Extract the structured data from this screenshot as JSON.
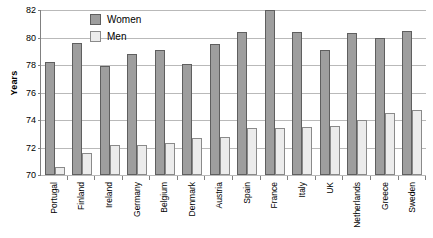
{
  "chart_data": {
    "type": "bar",
    "title": "",
    "xlabel": "",
    "ylabel": "Years",
    "ylim": [
      70,
      82
    ],
    "yticks": [
      70,
      72,
      74,
      76,
      78,
      80,
      82
    ],
    "grid": true,
    "legend_position": "top-center",
    "categories": [
      "Portugal",
      "Finland",
      "Ireland",
      "Germany",
      "Belgium",
      "Denmark",
      "Austria",
      "Spain",
      "France",
      "Italy",
      "UK",
      "Netherlands",
      "Greece",
      "Sweden"
    ],
    "series": [
      {
        "name": "Women",
        "color": "#9e9e9e",
        "values": [
          78.2,
          79.6,
          77.9,
          78.8,
          79.1,
          78.1,
          79.5,
          80.4,
          82.0,
          80.4,
          79.1,
          80.3,
          80.0,
          80.5
        ]
      },
      {
        "name": "Men",
        "color": "#ececec",
        "values": [
          70.6,
          71.6,
          72.2,
          72.2,
          72.3,
          72.7,
          72.8,
          73.4,
          73.4,
          73.5,
          73.6,
          74.0,
          74.5,
          74.7
        ]
      }
    ]
  },
  "legend": {
    "items": [
      {
        "label": "Women",
        "key": "women"
      },
      {
        "label": "Men",
        "key": "men"
      }
    ]
  },
  "axis": {
    "y_title": "Years",
    "y_tick_labels": [
      "82",
      "80",
      "78",
      "76",
      "74",
      "72",
      "70"
    ]
  }
}
